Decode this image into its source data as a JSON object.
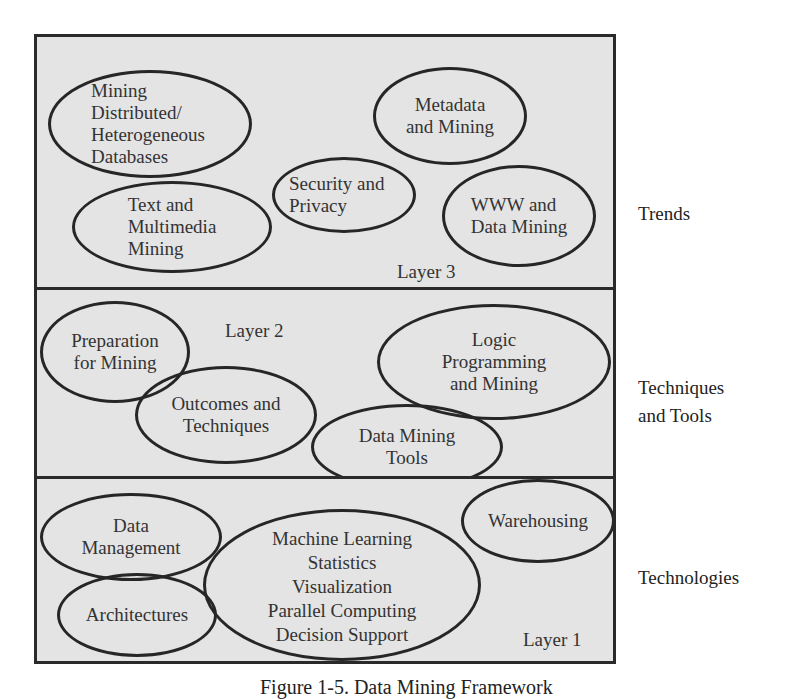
{
  "diagram": {
    "title": "Data Mining Framework",
    "layers": [
      {
        "id": "layer3",
        "label": "Layer 3",
        "side_label": "Trends",
        "nodes": [
          {
            "label": "Mining\nDistributed/\nHeterogeneous\nDatabases"
          },
          {
            "label": "Text and\nMultimedia\nMining"
          },
          {
            "label": "Security and\nPrivacy"
          },
          {
            "label": "Metadata\nand Mining"
          },
          {
            "label": "WWW and\nData Mining"
          }
        ]
      },
      {
        "id": "layer2",
        "label": "Layer 2",
        "side_label": "Techniques\nand Tools",
        "nodes": [
          {
            "label": "Preparation\nfor Mining"
          },
          {
            "label": "Outcomes and\nTechniques"
          },
          {
            "label": "Logic\nProgramming\nand Mining"
          },
          {
            "label": "Data Mining\nTools"
          }
        ]
      },
      {
        "id": "layer1",
        "label": "Layer 1",
        "side_label": "Technologies",
        "nodes": [
          {
            "label": "Data\nManagement"
          },
          {
            "label": "Architectures"
          },
          {
            "label": "Machine Learning\nStatistics\nVisualization\nParallel Computing\nDecision Support"
          },
          {
            "label": "Warehousing"
          }
        ]
      }
    ],
    "caption": "Figure 1-5. Data Mining Framework"
  },
  "colors": {
    "frame_fill": "#e4e4e4",
    "stroke": "#262626",
    "background": "#ffffff"
  }
}
